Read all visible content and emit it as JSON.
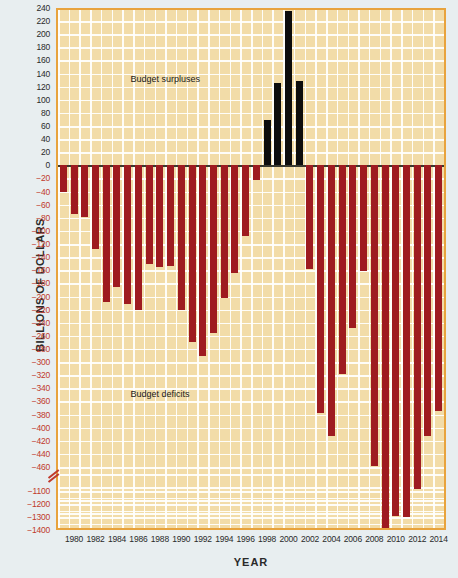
{
  "chart_data": {
    "type": "bar",
    "title": "",
    "xlabel": "YEAR",
    "ylabel": "BILLIONS OF DOLLARS",
    "grid": true,
    "legend_position": "none",
    "annotations": [
      {
        "text": "Budget surpluses",
        "x": 1989,
        "y": 130
      },
      {
        "text": "Budget deficits",
        "x": 1989,
        "y": -350
      }
    ],
    "y_axis": {
      "broken": true,
      "upper_ticks": [
        240,
        220,
        200,
        180,
        160,
        140,
        120,
        100,
        80,
        60,
        40,
        20,
        0,
        -20,
        -40,
        -60,
        -80,
        -100,
        -120,
        -140,
        -160,
        -180,
        -200,
        -220,
        -240,
        -260,
        -280,
        -300,
        -320,
        -340,
        -360,
        -380,
        -400,
        -420,
        -440,
        -460
      ],
      "lower_ticks": [
        -1100,
        -1200,
        -1300,
        -1400
      ],
      "upper_range": [
        -460,
        240
      ],
      "lower_range": [
        -1450,
        -1050
      ],
      "break_between": [
        -460,
        -1100
      ]
    },
    "x_axis": {
      "tick_labels": [
        "1980",
        "1982",
        "1984",
        "1986",
        "1988",
        "1990",
        "1992",
        "1994",
        "1996",
        "1998",
        "2000",
        "2002",
        "2004",
        "2006",
        "2008",
        "2010",
        "2012",
        "2014"
      ],
      "first_year": 1979,
      "last_year": 2014
    },
    "categories": [
      1979,
      1980,
      1981,
      1982,
      1983,
      1984,
      1985,
      1986,
      1987,
      1988,
      1989,
      1990,
      1991,
      1992,
      1993,
      1994,
      1995,
      1996,
      1997,
      1998,
      1999,
      2000,
      2001,
      2002,
      2003,
      2004,
      2005,
      2006,
      2007,
      2008,
      2009,
      2010,
      2011,
      2012,
      2013,
      2014
    ],
    "values": [
      -40,
      -74,
      -79,
      -128,
      -208,
      -185,
      -212,
      -221,
      -150,
      -155,
      -153,
      -221,
      -269,
      -290,
      -255,
      -203,
      -164,
      -107,
      -22,
      69,
      126,
      236,
      128,
      -158,
      -378,
      -413,
      -318,
      -248,
      -161,
      -459,
      -1413,
      -1294,
      -1300,
      -1087,
      -680,
      -485
    ],
    "units": "Billions of dollars",
    "series_colors": {
      "deficit": "#9e1b20",
      "surplus": "#0d0d0d"
    }
  },
  "style": {
    "plot_background": "#f2dca8",
    "plot_border": "#e8a33d",
    "page_background": "#e8eef0",
    "gridline": "#ffffff",
    "negative_tick_color": "#c0392b"
  }
}
